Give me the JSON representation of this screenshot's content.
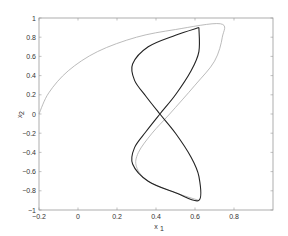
{
  "chart_data": {
    "type": "line",
    "title": "",
    "xlabel": "x1",
    "ylabel": "x2",
    "xlim": [
      -0.2,
      1.0
    ],
    "ylim": [
      -1.0,
      1.0
    ],
    "grid": false,
    "x_ticks": [
      "-0.2",
      "0",
      "0.2",
      "0.4",
      "0.6",
      "0.8"
    ],
    "y_ticks": [
      "-1",
      "-0.8",
      "-0.6",
      "-0.4",
      "-0.2",
      "0",
      "0.2",
      "0.4",
      "0.6",
      "0.8",
      "1"
    ],
    "series": [
      {
        "name": "limit cycle",
        "color": "#222222",
        "points": [
          [
            0.62,
            0.9
          ],
          [
            0.5,
            0.82
          ],
          [
            0.36,
            0.7
          ],
          [
            0.28,
            0.52
          ],
          [
            0.29,
            0.35
          ],
          [
            0.35,
            0.18
          ],
          [
            0.42,
            0.0
          ],
          [
            0.5,
            -0.2
          ],
          [
            0.58,
            -0.45
          ],
          [
            0.62,
            -0.65
          ],
          [
            0.62,
            -0.9
          ],
          [
            0.5,
            -0.82
          ],
          [
            0.36,
            -0.7
          ],
          [
            0.28,
            -0.52
          ],
          [
            0.29,
            -0.35
          ],
          [
            0.35,
            -0.18
          ],
          [
            0.42,
            0.0
          ],
          [
            0.5,
            0.2
          ],
          [
            0.58,
            0.45
          ],
          [
            0.62,
            0.65
          ],
          [
            0.62,
            0.9
          ]
        ]
      },
      {
        "name": "transient trajectory",
        "color": "#aaaaaa",
        "points": [
          [
            -0.2,
            0.0
          ],
          [
            -0.15,
            0.22
          ],
          [
            -0.05,
            0.45
          ],
          [
            0.1,
            0.65
          ],
          [
            0.3,
            0.8
          ],
          [
            0.5,
            0.88
          ],
          [
            0.73,
            0.94
          ],
          [
            0.74,
            0.8
          ],
          [
            0.7,
            0.55
          ],
          [
            0.6,
            0.3
          ],
          [
            0.47,
            0.0
          ],
          [
            0.38,
            -0.2
          ],
          [
            0.31,
            -0.4
          ],
          [
            0.3,
            -0.55
          ],
          [
            0.36,
            -0.7
          ],
          [
            0.5,
            -0.82
          ],
          [
            0.62,
            -0.9
          ]
        ]
      }
    ]
  },
  "labels": {
    "xlabel_main": "x",
    "xlabel_sub": "1",
    "ylabel_main": "x",
    "ylabel_sub": "2"
  }
}
